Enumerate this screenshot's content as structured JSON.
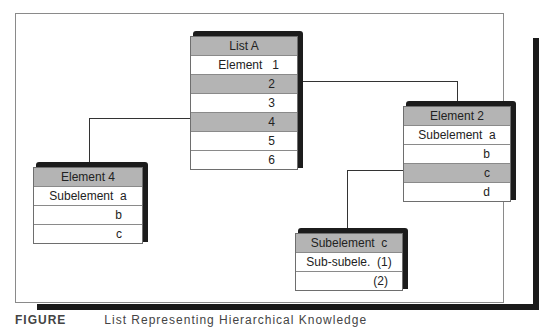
{
  "diagram": {
    "boxes": {
      "list_a": {
        "header": "List A",
        "rows": [
          {
            "label": "Element   1",
            "highlighted": false
          },
          {
            "label": "2",
            "highlighted": true
          },
          {
            "label": "3",
            "highlighted": false
          },
          {
            "label": "4",
            "highlighted": true
          },
          {
            "label": "5",
            "highlighted": false
          },
          {
            "label": "6",
            "highlighted": false
          }
        ]
      },
      "element_2": {
        "header": "Element 2",
        "rows": [
          {
            "label": "Subelement  a",
            "highlighted": false
          },
          {
            "label": "b",
            "highlighted": false
          },
          {
            "label": "c",
            "highlighted": true
          },
          {
            "label": "d",
            "highlighted": false
          }
        ]
      },
      "element_4": {
        "header": "Element 4",
        "rows": [
          {
            "label": "Subelement  a",
            "highlighted": false
          },
          {
            "label": "b",
            "highlighted": false
          },
          {
            "label": "c",
            "highlighted": false
          }
        ]
      },
      "subelement_c": {
        "header": "Subelement  c",
        "rows": [
          {
            "label": "Sub-subele.  (1)",
            "highlighted": false
          },
          {
            "label": "(2)",
            "highlighted": false
          }
        ]
      }
    },
    "connections": [
      {
        "from": "List A / 2",
        "to": "Element 2"
      },
      {
        "from": "List A / 4",
        "to": "Element 4"
      },
      {
        "from": "Element 2 / c",
        "to": "Subelement c"
      }
    ],
    "colors": {
      "highlight": "#b4b4b4",
      "shadow": "#1c1c1c",
      "line": "#333333"
    }
  },
  "caption": {
    "figure": "FIGURE",
    "text": "List Representing Hierarchical Knowledge"
  }
}
